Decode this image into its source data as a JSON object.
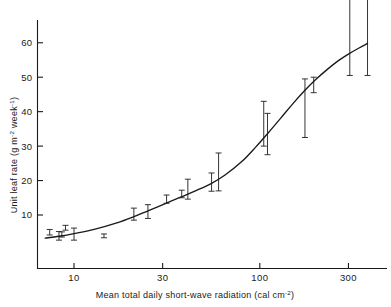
{
  "chart_data": {
    "type": "scatter",
    "title": "",
    "xlabel": "Mean total daily short-wave radiation (cal cm-2)",
    "xlabel_main": "Mean total daily short-wave radiation (cal cm",
    "xlabel_sup": "-2",
    "xlabel_tail": ")",
    "ylabel": "Unit leaf rate (g m-2 week-1)",
    "ylabel_part1": "Unit leaf rate (g m",
    "ylabel_sup1": "-2",
    "ylabel_part2": " week",
    "ylabel_sup2": "-1",
    "ylabel_tail": ")",
    "xscale": "log",
    "yscale": "linear",
    "xlim": [
      6.2,
      420
    ],
    "ylim": [
      0,
      66
    ],
    "grid": false,
    "legend": "none",
    "xticks": [
      10,
      30,
      100,
      300
    ],
    "xtick_labels": [
      "10",
      "30",
      "100",
      "300"
    ],
    "yticks": [
      10,
      20,
      30,
      40,
      50,
      60
    ],
    "ytick_labels": [
      "10",
      "20",
      "30",
      "40",
      "50",
      "60"
    ],
    "series": [
      {
        "name": "Unit leaf rate observations",
        "marker": "error-bar",
        "points": [
          {
            "x": 7.4,
            "y": 5.0,
            "lo": 4.2,
            "hi": 5.8
          },
          {
            "x": 8.3,
            "y": 4.0,
            "lo": 2.7,
            "hi": 5.2
          },
          {
            "x": 8.6,
            "y": 4.3,
            "lo": 3.6,
            "hi": 5.1
          },
          {
            "x": 9.0,
            "y": 6.3,
            "lo": 5.6,
            "hi": 7.0
          },
          {
            "x": 10.0,
            "y": 4.6,
            "lo": 2.7,
            "hi": 6.2
          },
          {
            "x": 14.5,
            "y": 3.9,
            "lo": 3.4,
            "hi": 4.5
          },
          {
            "x": 21.0,
            "y": 10.2,
            "lo": 8.5,
            "hi": 12.0
          },
          {
            "x": 25.0,
            "y": 11.0,
            "lo": 9.0,
            "hi": 13.0
          },
          {
            "x": 31.5,
            "y": 14.5,
            "lo": 13.4,
            "hi": 15.8
          },
          {
            "x": 38.0,
            "y": 16.0,
            "lo": 15.0,
            "hi": 17.2
          },
          {
            "x": 41.0,
            "y": 17.0,
            "lo": 14.6,
            "hi": 20.4
          },
          {
            "x": 55.0,
            "y": 19.6,
            "lo": 16.9,
            "hi": 22.2
          },
          {
            "x": 60.0,
            "y": 21.5,
            "lo": 17.0,
            "hi": 28.0
          },
          {
            "x": 105.0,
            "y": 33.0,
            "lo": 30.0,
            "hi": 43.0
          },
          {
            "x": 110.0,
            "y": 34.0,
            "lo": 27.5,
            "hi": 39.5
          },
          {
            "x": 175.0,
            "y": 44.0,
            "lo": 32.5,
            "hi": 49.5
          },
          {
            "x": 195.0,
            "y": 48.0,
            "lo": 45.5,
            "hi": 50.0
          },
          {
            "x": 305.0,
            "y": 61.0,
            "lo": 50.5,
            "hi": 73.0
          },
          {
            "x": 380.0,
            "y": 61.5,
            "lo": 50.5,
            "hi": 73.0
          }
        ]
      },
      {
        "name": "Fitted sigmoid curve",
        "marker": "line",
        "curve": [
          {
            "x": 7.0,
            "y": 3.3
          },
          {
            "x": 8.5,
            "y": 3.9
          },
          {
            "x": 10.0,
            "y": 4.6
          },
          {
            "x": 13.0,
            "y": 5.9
          },
          {
            "x": 17.0,
            "y": 7.7
          },
          {
            "x": 21.0,
            "y": 9.5
          },
          {
            "x": 25.0,
            "y": 11.2
          },
          {
            "x": 31.0,
            "y": 13.3
          },
          {
            "x": 38.0,
            "y": 15.3
          },
          {
            "x": 45.0,
            "y": 17.0
          },
          {
            "x": 55.0,
            "y": 19.2
          },
          {
            "x": 65.0,
            "y": 21.6
          },
          {
            "x": 80.0,
            "y": 25.5
          },
          {
            "x": 95.0,
            "y": 29.7
          },
          {
            "x": 110.0,
            "y": 33.6
          },
          {
            "x": 130.0,
            "y": 38.2
          },
          {
            "x": 150.0,
            "y": 42.2
          },
          {
            "x": 175.0,
            "y": 46.2
          },
          {
            "x": 200.0,
            "y": 49.3
          },
          {
            "x": 230.0,
            "y": 52.2
          },
          {
            "x": 265.0,
            "y": 54.8
          },
          {
            "x": 300.0,
            "y": 56.7
          },
          {
            "x": 340.0,
            "y": 58.4
          },
          {
            "x": 380.0,
            "y": 59.8
          }
        ]
      }
    ]
  }
}
